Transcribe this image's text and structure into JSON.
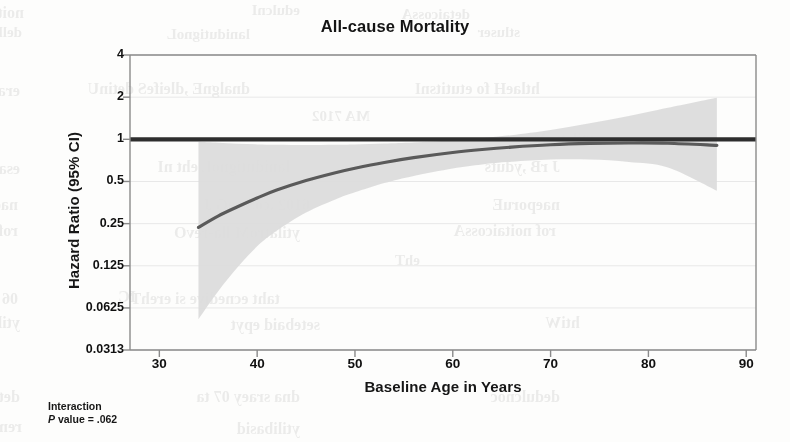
{
  "figure": {
    "title": "All-cause Mortality",
    "xlabel": "Baseline Age in Years",
    "ylabel": "Hazard Ratio (95% CI)",
    "footnote_line1": "Interaction",
    "footnote_p_italic": "P",
    "footnote_line2_rest": " value = .062"
  },
  "colors": {
    "curve": "#5a5a5a",
    "reference_line": "#2e2e2e",
    "ci_band": "#dcdcdc",
    "axis": "#8a8a8a",
    "gridline": "#e8e8e8",
    "text": "#111111",
    "page_background": "#fdfdfc"
  },
  "chart_data": {
    "type": "line",
    "title": "All-cause Mortality",
    "subtitle": "",
    "xlabel": "Baseline Age in Years",
    "ylabel": "Hazard Ratio (95% CI)",
    "yscale": "log2",
    "xlim": [
      27,
      91
    ],
    "ylim": [
      0.0313,
      4
    ],
    "grid": true,
    "legend": null,
    "xticks": [
      30,
      40,
      50,
      60,
      70,
      80,
      90
    ],
    "xtick_labels": [
      "30",
      "40",
      "50",
      "60",
      "70",
      "80",
      "90"
    ],
    "yticks": [
      4,
      2,
      1,
      0.5,
      0.25,
      0.125,
      0.0625,
      0.0313
    ],
    "ytick_labels": [
      "4",
      "2",
      "1",
      "0.5",
      "0.25",
      "0.125",
      "0.0625",
      "0.0313"
    ],
    "reference_line": {
      "y": 1,
      "label": "Hazard Ratio = 1 (null)",
      "style": "solid-thick"
    },
    "series": [
      {
        "name": "Hazard ratio (fitted spline)",
        "style": "line",
        "x": [
          34,
          36,
          38,
          40,
          42,
          45,
          48,
          50,
          53,
          56,
          60,
          63,
          66,
          70,
          74,
          78,
          82,
          87
        ],
        "values": [
          0.235,
          0.283,
          0.33,
          0.381,
          0.434,
          0.508,
          0.578,
          0.622,
          0.684,
          0.74,
          0.805,
          0.846,
          0.88,
          0.915,
          0.935,
          0.942,
          0.938,
          0.905
        ]
      },
      {
        "name": "95% CI upper bound",
        "style": "band-upper",
        "x": [
          34,
          36,
          38,
          40,
          42,
          45,
          48,
          50,
          53,
          56,
          60,
          63,
          66,
          70,
          74,
          78,
          82,
          87
        ],
        "values": [
          0.96,
          0.945,
          0.93,
          0.92,
          0.915,
          0.912,
          0.915,
          0.92,
          0.932,
          0.948,
          0.985,
          1.02,
          1.07,
          1.165,
          1.3,
          1.47,
          1.68,
          1.98
        ]
      },
      {
        "name": "95% CI lower bound",
        "style": "band-lower",
        "x": [
          34,
          36,
          38,
          40,
          42,
          45,
          48,
          50,
          53,
          56,
          60,
          63,
          66,
          70,
          74,
          78,
          82,
          87
        ],
        "values": [
          0.052,
          0.082,
          0.122,
          0.172,
          0.222,
          0.3,
          0.372,
          0.418,
          0.487,
          0.548,
          0.62,
          0.662,
          0.692,
          0.718,
          0.718,
          0.69,
          0.63,
          0.43
        ]
      }
    ],
    "annotations": [
      {
        "text": "Interaction P value = .062",
        "position": "below-axis-left"
      }
    ]
  },
  "bleed_through": [
    {
      "text": "noitcaretnI",
      "x": 24,
      "y": 4,
      "size": 16
    },
    {
      "text": "edulcnI",
      "x": 300,
      "y": 2,
      "size": 15
    },
    {
      "text": "detaicossA",
      "x": 470,
      "y": 6,
      "size": 15
    },
    {
      "text": "dellortnoC",
      "x": 22,
      "y": 24,
      "size": 15
    },
    {
      "text": "lanidutignoL",
      "x": 250,
      "y": 26,
      "size": 15
    },
    {
      "text": "stluser",
      "x": 520,
      "y": 24,
      "size": 15
    },
    {
      "text": "erachtlaeH fo esU",
      "x": 20,
      "y": 82,
      "size": 16
    },
    {
      "text": "dnalgnE ,dleifeS detinU",
      "x": 250,
      "y": 80,
      "size": 16
    },
    {
      "text": "htlaeH fo etutitsnI",
      "x": 540,
      "y": 80,
      "size": 16
    },
    {
      "text": "MA 7102",
      "x": 370,
      "y": 108,
      "size": 15
    },
    {
      "text": "ytilatroM",
      "x": 594,
      "y": 130,
      "size": 15
    },
    {
      "text": "esaesiD lanerorepyH",
      "x": 20,
      "y": 160,
      "size": 16
    },
    {
      "text": "lanidutignoL eht nI",
      "x": 290,
      "y": 158,
      "size": 16
    },
    {
      "text": "J rB ,yduts",
      "x": 560,
      "y": 158,
      "size": 16
    },
    {
      "text": "naeporuE 8102",
      "x": 18,
      "y": 196,
      "size": 16
    },
    {
      "text": "6102 ,coS reG J",
      "x": 310,
      "y": 196,
      "size": 16
    },
    {
      "text": "naeporuE",
      "x": 560,
      "y": 196,
      "size": 16
    },
    {
      "text": "rof noitaicossA",
      "x": 18,
      "y": 222,
      "size": 16
    },
    {
      "text": "ytilatroM lla-revO",
      "x": 300,
      "y": 224,
      "size": 16
    },
    {
      "text": "rof noitaicossA",
      "x": 556,
      "y": 222,
      "size": 16
    },
    {
      "text": "ehT",
      "x": 420,
      "y": 252,
      "size": 15
    },
    {
      "text": "IC",
      "x": 136,
      "y": 288,
      "size": 16
    },
    {
      "text": "06 ot 05 morF",
      "x": 18,
      "y": 290,
      "size": 16
    },
    {
      "text": "taht ecnedive si erehT",
      "x": 280,
      "y": 290,
      "size": 16
    },
    {
      "text": "ytilatroM",
      "x": 20,
      "y": 314,
      "size": 16
    },
    {
      "text": "setebaid epyt",
      "x": 320,
      "y": 316,
      "size": 16
    },
    {
      "text": "htiW",
      "x": 580,
      "y": 314,
      "size": 16
    },
    {
      "text": "detroper saw ksir",
      "x": 20,
      "y": 388,
      "size": 16
    },
    {
      "text": "dna sraey 07 ta",
      "x": 300,
      "y": 388,
      "size": 16
    },
    {
      "text": "dedulcnoc",
      "x": 560,
      "y": 388,
      "size": 16
    },
    {
      "text": "remitlA",
      "x": 22,
      "y": 418,
      "size": 16
    },
    {
      "text": "ytilibasid",
      "x": 300,
      "y": 420,
      "size": 16
    }
  ]
}
